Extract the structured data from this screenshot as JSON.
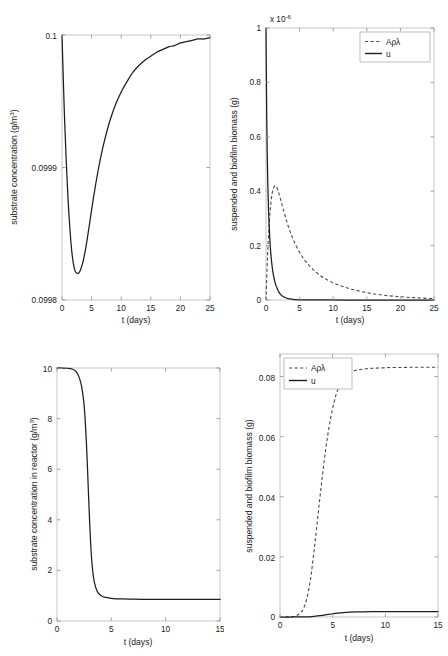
{
  "figure": {
    "title": "",
    "background": "#ffffff",
    "curve_color": "#1d1d1d",
    "dashed_color": "#4a4a4a",
    "axis_color": "#b9b9b9"
  },
  "chart_data": [
    {
      "id": "top-left",
      "type": "line",
      "title": "",
      "xlabel": "t (days)",
      "ylabel": "substrate concentration (g/m³)",
      "xlim": [
        0,
        25
      ],
      "ylim": [
        0.0998,
        0.1
      ],
      "xticks": [
        0,
        5,
        10,
        15,
        20,
        25
      ],
      "xticklabels": [
        "0",
        "5",
        "10",
        "15",
        "20",
        "25"
      ],
      "yticks": [
        0.0998,
        0.0999,
        0.1
      ],
      "yticklabels": [
        "0.0998",
        "0.0999",
        "0.1"
      ],
      "grid": false,
      "legend": null,
      "series": [
        {
          "name": "substrate concentration",
          "style": "solid",
          "x": [
            0,
            0.1,
            0.25,
            0.45,
            0.7,
            1.0,
            1.3,
            1.6,
            1.9,
            2.2,
            2.5,
            2.8,
            3.1,
            3.5,
            4.0,
            4.5,
            5.0,
            5.6,
            6.2,
            7.0,
            8.0,
            9.0,
            10.0,
            11.0,
            12.0,
            13.0,
            14.0,
            15.0,
            16.0,
            17.0,
            18.0,
            19.0,
            20.0,
            21.0,
            22.0,
            23.0,
            24.0,
            25.0
          ],
          "y": [
            0.1,
            0.099985,
            0.099962,
            0.099935,
            0.099907,
            0.099878,
            0.099856,
            0.099839,
            0.099828,
            0.099822,
            0.0998202,
            0.0998203,
            0.0998225,
            0.099828,
            0.099839,
            0.099853,
            0.099868,
            0.099885,
            0.0999,
            0.099917,
            0.099934,
            0.099947,
            0.099957,
            0.099965,
            0.099972,
            0.099977,
            0.099981,
            0.099984,
            0.099987,
            0.099989,
            0.099991,
            0.099992,
            0.099994,
            0.099995,
            0.099996,
            0.099997,
            0.099997,
            0.099998
          ]
        }
      ]
    },
    {
      "id": "top-right",
      "type": "line",
      "title": "",
      "xlabel": "t (days)",
      "ylabel": "suspended and biofilm biomass (g)",
      "y_exponent_label": "x 10",
      "y_exponent_power": "-6",
      "xlim": [
        0,
        25
      ],
      "ylim": [
        0,
        1.0
      ],
      "y_scale": 1e-06,
      "xticks": [
        0,
        5,
        10,
        15,
        20,
        25
      ],
      "xticklabels": [
        "0",
        "5",
        "10",
        "15",
        "20",
        "25"
      ],
      "yticks": [
        0,
        0.2,
        0.4,
        0.6,
        0.8,
        1
      ],
      "yticklabels": [
        "0",
        "0.2",
        "0.4",
        "0.6",
        "0.8",
        "1"
      ],
      "grid": false,
      "legend": {
        "position": "top-right",
        "entries": [
          "Aρλ",
          "u"
        ]
      },
      "series": [
        {
          "name": "Aρλ",
          "style": "dashed",
          "x": [
            0,
            0.15,
            0.3,
            0.5,
            0.7,
            0.9,
            1.1,
            1.3,
            1.5,
            1.7,
            1.9,
            2.2,
            2.5,
            2.9,
            3.3,
            3.8,
            4.3,
            5.0,
            5.8,
            6.6,
            7.5,
            8.5,
            9.5,
            10.5,
            11.5,
            12.5,
            13.5,
            15.0,
            16.5,
            18.0,
            19.5,
            21.0,
            22.5,
            24.0,
            25.0
          ],
          "y": [
            0.0,
            0.11,
            0.2,
            0.29,
            0.35,
            0.39,
            0.41,
            0.42,
            0.418,
            0.408,
            0.394,
            0.368,
            0.34,
            0.305,
            0.272,
            0.238,
            0.209,
            0.175,
            0.145,
            0.122,
            0.101,
            0.083,
            0.069,
            0.058,
            0.049,
            0.041,
            0.035,
            0.027,
            0.021,
            0.016,
            0.013,
            0.01,
            0.008,
            0.006,
            0.005
          ]
        },
        {
          "name": "u",
          "style": "solid",
          "x": [
            0,
            0.05,
            0.1,
            0.18,
            0.28,
            0.4,
            0.55,
            0.7,
            0.9,
            1.1,
            1.35,
            1.6,
            1.9,
            2.2,
            2.5,
            2.9,
            3.3,
            3.8,
            4.3,
            5.0,
            6.0,
            7.0,
            9.0,
            12.0,
            16.0,
            20.0,
            25.0
          ],
          "y": [
            1.0,
            0.84,
            0.7,
            0.545,
            0.415,
            0.315,
            0.232,
            0.175,
            0.126,
            0.092,
            0.064,
            0.046,
            0.03,
            0.02,
            0.0135,
            0.0082,
            0.005,
            0.0028,
            0.0016,
            0.0008,
            0.0003,
            0.0001,
            3e-05,
            0.0,
            0.0,
            0.0,
            0.0
          ]
        }
      ]
    },
    {
      "id": "bottom-left",
      "type": "line",
      "title": "",
      "xlabel": "t (days)",
      "ylabel": "substrate concentration in reactor (g/m³)",
      "xlim": [
        0,
        15
      ],
      "ylim": [
        0,
        10
      ],
      "xticks": [
        0,
        5,
        10,
        15
      ],
      "xticklabels": [
        "0",
        "5",
        "10",
        "15"
      ],
      "yticks": [
        0,
        2,
        4,
        6,
        8,
        10
      ],
      "yticklabels": [
        "0",
        "2",
        "4",
        "6",
        "8",
        "10"
      ],
      "grid": false,
      "legend": null,
      "series": [
        {
          "name": "substrate concentration in reactor",
          "style": "solid",
          "x": [
            0,
            0.5,
            1.0,
            1.4,
            1.7,
            1.9,
            2.1,
            2.25,
            2.4,
            2.5,
            2.6,
            2.7,
            2.8,
            2.9,
            3.0,
            3.1,
            3.2,
            3.35,
            3.5,
            3.7,
            3.9,
            4.2,
            4.5,
            5.0,
            5.5,
            6.0,
            7.0,
            8.0,
            9.0,
            10.0,
            11.5,
            13.0,
            15.0
          ],
          "y": [
            10.0,
            10.0,
            9.99,
            9.96,
            9.88,
            9.76,
            9.55,
            9.3,
            8.9,
            8.5,
            7.9,
            7.1,
            6.1,
            5.0,
            3.95,
            3.05,
            2.38,
            1.75,
            1.42,
            1.18,
            1.06,
            0.97,
            0.93,
            0.895,
            0.878,
            0.87,
            0.862,
            0.858,
            0.856,
            0.855,
            0.854,
            0.853,
            0.852
          ]
        }
      ]
    },
    {
      "id": "bottom-right",
      "type": "line",
      "title": "",
      "xlabel": "t (days)",
      "ylabel": "suspended and biofilm biomass (g)",
      "xlim": [
        0,
        15
      ],
      "ylim": [
        0,
        0.0875
      ],
      "xticks": [
        0,
        5,
        10,
        15
      ],
      "xticklabels": [
        "0",
        "5",
        "10",
        "15"
      ],
      "yticks": [
        0,
        0.02,
        0.04,
        0.06,
        0.08
      ],
      "yticklabels": [
        "0",
        "0.02",
        "0.04",
        "0.06",
        "0.08"
      ],
      "grid": false,
      "legend": {
        "position": "top-left",
        "entries": [
          "Aρλ",
          "u"
        ]
      },
      "series": [
        {
          "name": "Aρλ",
          "style": "dashed",
          "x": [
            0,
            0.5,
            1.0,
            1.5,
            1.9,
            2.2,
            2.5,
            2.8,
            3.0,
            3.3,
            3.6,
            3.9,
            4.2,
            4.5,
            4.8,
            5.1,
            5.4,
            5.8,
            6.2,
            6.6,
            7.0,
            7.5,
            8.0,
            8.5,
            9.0,
            9.8,
            10.5,
            11.5,
            12.5,
            13.5,
            15.0
          ],
          "y": [
            0.0,
            0.0,
            0.0001,
            0.0004,
            0.0012,
            0.0026,
            0.0055,
            0.0105,
            0.0152,
            0.024,
            0.0336,
            0.0432,
            0.052,
            0.0597,
            0.066,
            0.071,
            0.0748,
            0.0782,
            0.0802,
            0.0813,
            0.0819,
            0.0823,
            0.0825,
            0.0827,
            0.0828,
            0.0829,
            0.083,
            0.083,
            0.0831,
            0.0831,
            0.0831
          ]
        },
        {
          "name": "u",
          "style": "solid",
          "x": [
            0,
            1.0,
            2.0,
            2.6,
            3.0,
            3.4,
            3.8,
            4.2,
            4.6,
            5.0,
            5.5,
            6.0,
            6.6,
            7.2,
            8.0,
            9.0,
            10.0,
            11.0,
            12.0,
            13.5,
            15.0
          ],
          "y": [
            0.0,
            0.0,
            2e-05,
            8e-05,
            0.00016,
            0.00028,
            0.00045,
            0.00065,
            0.00087,
            0.00108,
            0.0013,
            0.00146,
            0.00159,
            0.00167,
            0.00173,
            0.00177,
            0.00179,
            0.0018,
            0.00181,
            0.00181,
            0.00182
          ]
        }
      ]
    }
  ]
}
